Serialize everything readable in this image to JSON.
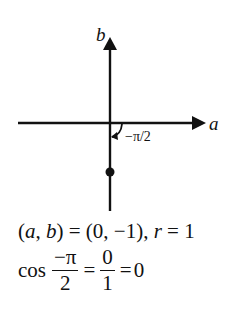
{
  "diagram": {
    "axes": {
      "horizontal_label": "a",
      "vertical_label": "b"
    },
    "angle_label": "−π/2",
    "point": {
      "a": 0,
      "b": -1
    }
  },
  "equations": {
    "line1": {
      "lhs": "(a, b)",
      "text": "(a, b) = (0, −1), r = 1",
      "parts": [
        "(",
        "a",
        ", ",
        "b",
        ") = (0, −1), ",
        "r",
        " = 1"
      ]
    },
    "line2": {
      "func": "cos",
      "frac1_num": "−π",
      "frac1_den": "2",
      "eq1": "=",
      "frac2_num": "0",
      "frac2_den": "1",
      "eq2": "=",
      "result": "0"
    }
  },
  "colors": {
    "ink": "#111111",
    "background": "#ffffff"
  }
}
